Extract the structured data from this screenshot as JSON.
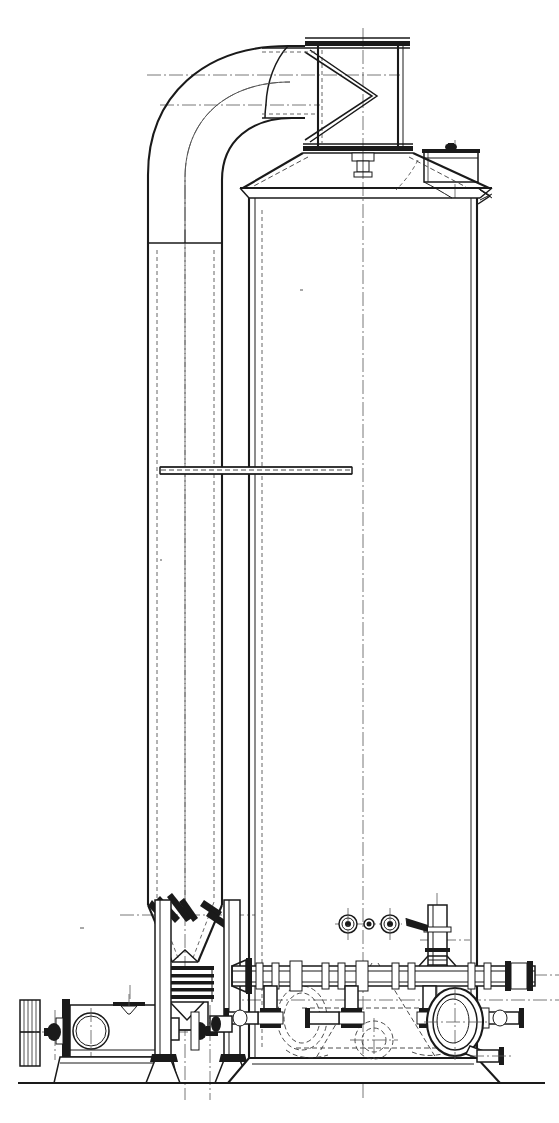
{
  "drawing": {
    "title": "Vertical Pressure Vessel with Inlet Elbow Duct — General Arrangement Elevation",
    "type": "technical-engineering-elevation",
    "sheet": {
      "width": 559,
      "height": 1123,
      "background": "#ffffff",
      "line_color": "#1a1a1a"
    },
    "view": "front elevation, sectioned",
    "ground_line_y": 1083
  },
  "components": {
    "inlet_elbow": {
      "name": "90-degree inlet elbow duct",
      "description": "Large radius 90 degree bend connecting vertical downcomer riser to horizontal inlet nozzle at vessel top",
      "outer_radius": 118,
      "inner_radius": 48
    },
    "riser_column": {
      "name": "vertical riser / downcomer column",
      "left_x": 148,
      "right_x": 222,
      "top_y": 240,
      "bottom_y": 905
    },
    "top_nozzle": {
      "name": "top outlet nozzle with flanges",
      "upper_flange_y": 38,
      "lower_flange_y": 148,
      "left_x": 310,
      "right_x": 407
    },
    "transition_cone": {
      "name": "conical transition head / reducer",
      "top_y": 160,
      "bottom_y": 192
    },
    "vessel_shell": {
      "name": "main vertical cylindrical vessel shell",
      "left_x": 249,
      "right_x": 477,
      "top_y": 192,
      "bottom_y": 1055
    },
    "manway_box": {
      "name": "rectangular access manway cover on head",
      "left_x": 424,
      "right_x": 478,
      "top_y": 148,
      "bottom_y": 181
    },
    "platform": {
      "name": "intermediate platform / support beam",
      "left_x": 160,
      "right_x": 352,
      "y": 470
    },
    "hopper": {
      "name": "conical hopper with internal baffle vanes",
      "top_y": 900,
      "bottom_y": 965
    },
    "bellows": {
      "name": "bellows expansion joint",
      "convolutions": 5,
      "top_y": 968,
      "bottom_y": 1000
    },
    "handwheel_valve": {
      "name": "gate valve with hatched handwheel",
      "handwheel_cx": 38,
      "handwheel_cy": 1030
    },
    "horizontal_header": {
      "name": "horizontal pipe header with unions and flanged tees",
      "y": 975,
      "left_x": 232,
      "right_x": 535
    },
    "manhole_port": {
      "name": "elliptical manhole / inspection port on shell",
      "cx": 455,
      "cy": 1022,
      "rx": 27,
      "ry": 33
    },
    "sight_nozzles": {
      "name": "three small nozzle connections",
      "count": 3,
      "cy": 924,
      "positions": [
        348,
        369,
        390
      ]
    },
    "vent_stack": {
      "name": "small vertical vent stack with lever handle",
      "cx": 437,
      "top_y": 905,
      "bottom_y": 980
    },
    "base_skirt": {
      "name": "base skirt / foundation plinth",
      "top_y": 1055,
      "bottom_y": 1083
    },
    "legs": {
      "name": "support legs for riser column",
      "count": 2,
      "positions": [
        163,
        232
      ]
    }
  },
  "line_styles": {
    "visible_outline": "solid",
    "hidden_edge": "dashed",
    "center_line": "dash-dot"
  }
}
